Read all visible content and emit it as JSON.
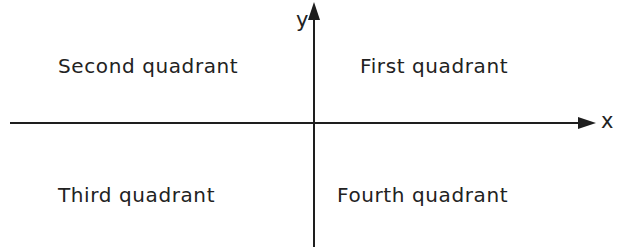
{
  "diagram": {
    "title": "",
    "axes": {
      "x_label": "x",
      "y_label": "y",
      "color": "#1e1e1e"
    },
    "quadrants": [
      {
        "id": "first",
        "label": "First quadrant",
        "position": "top-right"
      },
      {
        "id": "second",
        "label": "Second quadrant",
        "position": "top-left"
      },
      {
        "id": "third",
        "label": "Third quadrant",
        "position": "bottom-left"
      },
      {
        "id": "fourth",
        "label": "Fourth quadrant",
        "position": "bottom-right"
      }
    ]
  }
}
